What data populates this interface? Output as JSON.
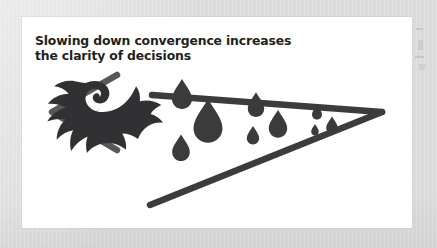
{
  "canvas": {
    "width": 437,
    "height": 248,
    "mat_color": "#dcdcdc",
    "card_color": "#ffffff"
  },
  "card": {
    "heading": {
      "line1": "Slowing down convergence increases",
      "line2": "the clarity of decisions",
      "color": "#1f1f21"
    }
  },
  "diagram": {
    "name": "convergence-funnel-diagram",
    "colors": {
      "chevron": "#58585a",
      "funnel_line": "#3c3c3e",
      "droplet": "#3b3b3d",
      "bird": "#313133"
    },
    "left_chevron": {
      "label": "left-chevron",
      "points": "95,58 30,95 95,133",
      "stroke_width": 6.5
    },
    "bird": {
      "label": "dove-icon",
      "description": "dove silhouette facing right"
    },
    "funnel": {
      "label": "funnel-triangle",
      "apex_x": 360,
      "apex_y": 95,
      "top_start_x": 130,
      "top_start_y": 78,
      "bottom_start_x": 128,
      "bottom_start_y": 188,
      "stroke_width": 6.5
    },
    "droplets": [
      {
        "label": "droplet-1",
        "cx": 160,
        "cy": 75,
        "scale": 1.0
      },
      {
        "label": "droplet-2",
        "cx": 186,
        "cy": 101,
        "scale": 1.45
      },
      {
        "label": "droplet-3",
        "cx": 159,
        "cy": 129,
        "scale": 0.88
      },
      {
        "label": "droplet-4",
        "cx": 234,
        "cy": 86,
        "scale": 0.82
      },
      {
        "label": "droplet-5",
        "cx": 256,
        "cy": 105,
        "scale": 0.92
      },
      {
        "label": "droplet-6",
        "cx": 231,
        "cy": 117,
        "scale": 0.62
      },
      {
        "label": "droplet-7",
        "cx": 295,
        "cy": 94,
        "scale": 0.5
      },
      {
        "label": "droplet-8",
        "cx": 310,
        "cy": 107,
        "scale": 0.58
      },
      {
        "label": "droplet-9",
        "cx": 293,
        "cy": 112,
        "scale": 0.38
      }
    ]
  }
}
